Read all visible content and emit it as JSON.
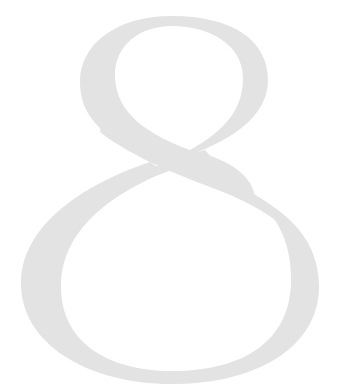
{
  "page": {
    "chapter_numeral": "8",
    "numeral_color": "#e3e3e3",
    "background_color": "#ffffff"
  }
}
